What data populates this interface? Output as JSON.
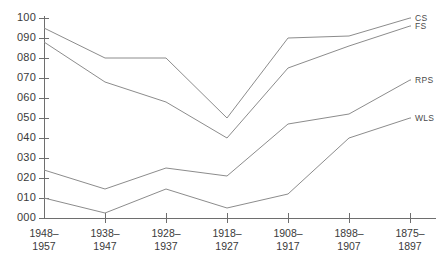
{
  "chart_data": {
    "type": "line",
    "title": "",
    "xlabel": "",
    "ylabel": "",
    "ylim": [
      0,
      100
    ],
    "grid": false,
    "legend_position": "right-inline",
    "categories": [
      "1948–\n1957",
      "1938–\n1947",
      "1928–\n1937",
      "1918–\n1927",
      "1908–\n1917",
      "1898–\n1907",
      "1875–\n1897"
    ],
    "category_lines": [
      [
        "1948–",
        "1957"
      ],
      [
        "1938–",
        "1947"
      ],
      [
        "1928–",
        "1937"
      ],
      [
        "1918–",
        "1927"
      ],
      [
        "1908–",
        "1917"
      ],
      [
        "1898–",
        "1907"
      ],
      [
        "1875–",
        "1897"
      ]
    ],
    "ytick_labels": [
      "000",
      "010",
      "020",
      "030",
      "040",
      "050",
      "060",
      "070",
      "080",
      "090",
      "100"
    ],
    "ytick_values": [
      0,
      10,
      20,
      30,
      40,
      50,
      60,
      70,
      80,
      90,
      100
    ],
    "series": [
      {
        "name": "CS",
        "values": [
          95,
          80,
          80,
          50,
          90,
          91,
          100
        ]
      },
      {
        "name": "FS",
        "values": [
          88,
          68,
          58,
          40,
          75,
          86,
          96
        ]
      },
      {
        "name": "RPS",
        "values": [
          24,
          14.5,
          25,
          21,
          47,
          52,
          69
        ]
      },
      {
        "name": "WLS",
        "values": [
          10,
          2.5,
          14.5,
          5,
          12,
          40,
          50
        ]
      }
    ],
    "line_color": "#8c8c8c",
    "axis_color": "#6e6e6e",
    "text_color": "#3a3a3a"
  }
}
